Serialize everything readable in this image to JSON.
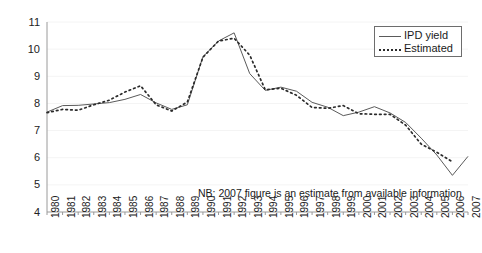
{
  "chart_data": {
    "type": "line",
    "title": "",
    "xlabel": "",
    "ylabel": "",
    "ylim": [
      4,
      11
    ],
    "yticks": [
      4,
      5,
      6,
      7,
      8,
      9,
      10,
      11
    ],
    "grid": false,
    "legend_position": "top-right",
    "annotation": "NB: 2007 figure is an estimate from available information",
    "categories": [
      "1980",
      "1981",
      "1982",
      "1983",
      "1984",
      "1985",
      "1986",
      "1987",
      "1988",
      "1989",
      "1990",
      "1991",
      "1992",
      "1993",
      "1994",
      "1995",
      "1996",
      "1997",
      "1998",
      "1999",
      "2000",
      "2001",
      "2002",
      "2003",
      "2004",
      "2005",
      "2006",
      "2007"
    ],
    "series": [
      {
        "name": "IPD yield",
        "style": "solid",
        "color": "#5a5a5a",
        "values": [
          7.68,
          7.92,
          7.93,
          7.98,
          8.03,
          8.15,
          8.33,
          8.02,
          7.78,
          7.95,
          9.72,
          10.3,
          10.6,
          9.1,
          8.48,
          8.6,
          8.45,
          8.04,
          7.86,
          7.55,
          7.68,
          7.88,
          7.65,
          7.3,
          6.72,
          6.1,
          5.35,
          6.05
        ]
      },
      {
        "name": "Estimated",
        "style": "dotted",
        "color": "#2b2b2b",
        "values": [
          7.66,
          7.78,
          7.75,
          7.95,
          8.12,
          8.42,
          8.65,
          7.95,
          7.72,
          8.05,
          9.7,
          10.3,
          10.4,
          9.78,
          8.5,
          8.56,
          8.3,
          7.85,
          7.82,
          7.92,
          7.62,
          7.6,
          7.6,
          7.2,
          6.5,
          6.2,
          5.85,
          null
        ]
      }
    ]
  },
  "legend": {
    "items": [
      {
        "label": "IPD yield"
      },
      {
        "label": "Estimated"
      }
    ]
  },
  "note": {
    "text": "NB: 2007 figure is an estimate from available information"
  }
}
